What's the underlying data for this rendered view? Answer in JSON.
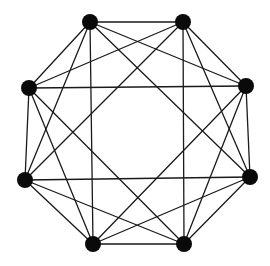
{
  "diagram": {
    "type": "graph",
    "node_color": "#0a0a0a",
    "edge_color": "#1a1a1a",
    "node_radius": 8,
    "nodes": [
      {
        "id": "A",
        "x": 90,
        "y": 22
      },
      {
        "id": "B",
        "x": 183,
        "y": 22
      },
      {
        "id": "C",
        "x": 246,
        "y": 86
      },
      {
        "id": "D",
        "x": 250,
        "y": 177
      },
      {
        "id": "E",
        "x": 184,
        "y": 244
      },
      {
        "id": "F",
        "x": 93,
        "y": 244
      },
      {
        "id": "G",
        "x": 25,
        "y": 180
      },
      {
        "id": "H",
        "x": 29,
        "y": 88
      }
    ],
    "edges": [
      [
        "A",
        "B"
      ],
      [
        "A",
        "C"
      ],
      [
        "A",
        "D"
      ],
      [
        "A",
        "F"
      ],
      [
        "A",
        "G"
      ],
      [
        "A",
        "H"
      ],
      [
        "B",
        "C"
      ],
      [
        "B",
        "D"
      ],
      [
        "B",
        "E"
      ],
      [
        "B",
        "G"
      ],
      [
        "B",
        "H"
      ],
      [
        "C",
        "D"
      ],
      [
        "C",
        "E"
      ],
      [
        "C",
        "F"
      ],
      [
        "C",
        "H"
      ],
      [
        "D",
        "E"
      ],
      [
        "D",
        "F"
      ],
      [
        "D",
        "G"
      ],
      [
        "E",
        "F"
      ],
      [
        "E",
        "G"
      ],
      [
        "E",
        "H"
      ],
      [
        "F",
        "G"
      ],
      [
        "F",
        "H"
      ],
      [
        "G",
        "H"
      ]
    ]
  }
}
